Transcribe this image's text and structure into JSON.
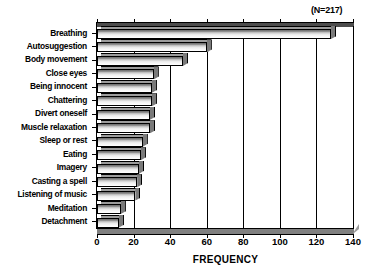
{
  "chart_data": {
    "type": "bar",
    "orientation": "horizontal",
    "title": "",
    "annotation": "(N=217)",
    "xlabel": "FREQUENCY",
    "ylabel": "",
    "xlim": [
      0,
      140
    ],
    "xticks": [
      0,
      20,
      40,
      60,
      80,
      100,
      120,
      140
    ],
    "grid": "vertical",
    "legend": null,
    "sample_size": 217,
    "categories": [
      "Breathing",
      "Autosuggestion",
      "Body movement",
      "Close eyes",
      "Being innocent",
      "Chattering",
      "Divert oneself",
      "Muscle relaxation",
      "Sleep or rest",
      "Eating",
      "Imagery",
      "Casting a spell",
      "Listening of music",
      "Meditation",
      "Detachment"
    ],
    "values": [
      128,
      60,
      47,
      31,
      30,
      30,
      29,
      29,
      25,
      24,
      23,
      22,
      21,
      13,
      12
    ]
  },
  "axis": {
    "x_title": "FREQUENCY",
    "tick_labels": [
      "0",
      "20",
      "40",
      "60",
      "80",
      "100",
      "120",
      "140"
    ]
  },
  "annotation": {
    "n_label": "(N=217)"
  }
}
